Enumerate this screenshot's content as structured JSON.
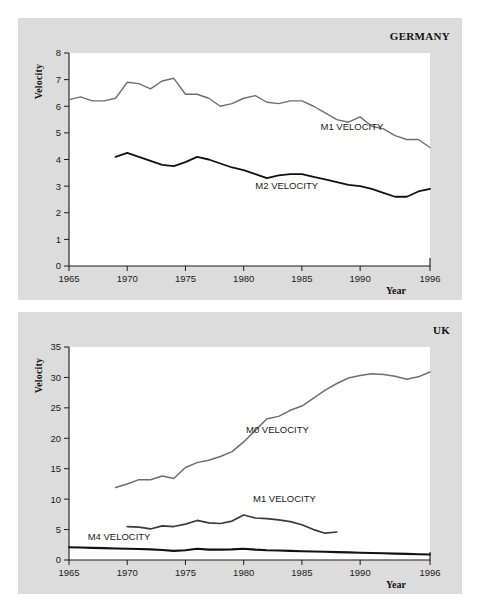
{
  "figure": {
    "background_color": "#ffffff",
    "panel_color": "#dcdcdc",
    "plot_color": "#ffffff"
  },
  "panels": [
    {
      "id": "germany",
      "title": "GERMANY",
      "ylabel": "Velocity",
      "xlabel": "Year"
    },
    {
      "id": "uk",
      "title": "UK",
      "ylabel": "Velocity",
      "xlabel": "Year"
    }
  ],
  "chart_data": [
    {
      "type": "line",
      "title": "GERMANY",
      "xlabel": "Year",
      "ylabel": "Velocity",
      "xlim": [
        1965,
        1996
      ],
      "ylim": [
        0,
        8
      ],
      "xticks": [
        1965,
        1970,
        1975,
        1980,
        1985,
        1990,
        1996
      ],
      "xtick_labels": [
        "1965",
        "1970",
        "1975",
        "1980",
        "1985",
        "1990",
        "1996"
      ],
      "yticks": [
        0,
        1,
        2,
        3,
        4,
        5,
        6,
        7,
        8
      ],
      "ytick_labels": [
        "0",
        "1",
        "2",
        "3",
        "4",
        "5",
        "6",
        "7",
        "8"
      ],
      "grid": false,
      "legend": "inline-annotations",
      "series": [
        {
          "name": "M1 VELOCITY",
          "color": "#6e6e6e",
          "width": 1.4,
          "label_x": 1986.6,
          "label_y": 5.12,
          "x": [
            1965,
            1966,
            1967,
            1968,
            1969,
            1970,
            1971,
            1972,
            1973,
            1974,
            1975,
            1976,
            1977,
            1978,
            1979,
            1980,
            1981,
            1982,
            1983,
            1984,
            1985,
            1986,
            1987,
            1988,
            1989,
            1990,
            1991,
            1992,
            1993,
            1994,
            1995,
            1996
          ],
          "y": [
            6.25,
            6.35,
            6.2,
            6.2,
            6.3,
            6.9,
            6.85,
            6.65,
            6.95,
            7.05,
            6.45,
            6.45,
            6.3,
            6.0,
            6.1,
            6.3,
            6.4,
            6.15,
            6.1,
            6.2,
            6.2,
            6.0,
            5.75,
            5.5,
            5.4,
            5.6,
            5.25,
            5.15,
            4.9,
            4.75,
            4.75,
            4.45
          ]
        },
        {
          "name": "M2 VELOCITY",
          "color": "#111111",
          "width": 1.8,
          "label_x": 1981.0,
          "label_y": 2.88,
          "x": [
            1969,
            1970,
            1971,
            1972,
            1973,
            1974,
            1975,
            1976,
            1977,
            1978,
            1979,
            1980,
            1981,
            1982,
            1983,
            1984,
            1985,
            1986,
            1987,
            1988,
            1989,
            1990,
            1991,
            1992,
            1993,
            1994,
            1995,
            1996
          ],
          "y": [
            4.1,
            4.25,
            4.1,
            3.95,
            3.8,
            3.75,
            3.9,
            4.1,
            4.0,
            3.85,
            3.7,
            3.6,
            3.45,
            3.3,
            3.4,
            3.45,
            3.45,
            3.35,
            3.25,
            3.15,
            3.05,
            3.0,
            2.9,
            2.75,
            2.6,
            2.6,
            2.8,
            2.9
          ]
        }
      ]
    },
    {
      "type": "line",
      "title": "UK",
      "xlabel": "Year",
      "ylabel": "Velocity",
      "xlim": [
        1965,
        1996
      ],
      "ylim": [
        0,
        35
      ],
      "xticks": [
        1965,
        1970,
        1975,
        1980,
        1985,
        1990,
        1996
      ],
      "xtick_labels": [
        "1965",
        "1970",
        "1975",
        "1980",
        "1985",
        "1990",
        "1996"
      ],
      "yticks": [
        0,
        5,
        10,
        15,
        20,
        25,
        30,
        35
      ],
      "ytick_labels": [
        "0",
        "5",
        "10",
        "15",
        "20",
        "25",
        "30",
        "35"
      ],
      "grid": false,
      "legend": "inline-annotations",
      "series": [
        {
          "name": "M0 VELOCITY",
          "color": "#6e6e6e",
          "width": 1.5,
          "label_x": 1980.2,
          "label_y": 20.8,
          "x": [
            1969,
            1970,
            1971,
            1972,
            1973,
            1974,
            1975,
            1976,
            1977,
            1978,
            1979,
            1980,
            1981,
            1982,
            1983,
            1984,
            1985,
            1986,
            1987,
            1988,
            1989,
            1990,
            1991,
            1992,
            1993,
            1994,
            1995,
            1996
          ],
          "y": [
            11.9,
            12.5,
            13.2,
            13.2,
            13.8,
            13.4,
            15.2,
            16.0,
            16.4,
            17.0,
            17.8,
            19.4,
            21.3,
            23.2,
            23.6,
            24.6,
            25.3,
            26.6,
            27.9,
            29.0,
            29.9,
            30.3,
            30.6,
            30.5,
            30.2,
            29.7,
            30.1,
            30.9
          ]
        },
        {
          "name": "M1 VELOCITY",
          "color": "#3a3a3a",
          "width": 1.7,
          "label_x": 1980.8,
          "label_y": 9.6,
          "x": [
            1970,
            1971,
            1972,
            1973,
            1974,
            1975,
            1976,
            1977,
            1978,
            1979,
            1980,
            1981,
            1982,
            1983,
            1984,
            1985,
            1986,
            1987,
            1988
          ],
          "y": [
            5.5,
            5.4,
            5.1,
            5.6,
            5.5,
            5.9,
            6.5,
            6.1,
            6.0,
            6.4,
            7.4,
            6.9,
            6.8,
            6.6,
            6.3,
            5.8,
            5.0,
            4.4,
            4.6
          ]
        },
        {
          "name": "M4 VELOCITY",
          "color": "#111111",
          "width": 2.1,
          "label_x": 1966.6,
          "label_y": 3.35,
          "x": [
            1965,
            1966,
            1967,
            1968,
            1969,
            1970,
            1971,
            1972,
            1973,
            1974,
            1975,
            1976,
            1977,
            1978,
            1979,
            1980,
            1981,
            1982,
            1983,
            1984,
            1985,
            1986,
            1987,
            1988,
            1989,
            1990,
            1991,
            1992,
            1993,
            1994,
            1995,
            1996
          ],
          "y": [
            2.1,
            2.05,
            2.0,
            1.95,
            1.9,
            1.85,
            1.8,
            1.75,
            1.65,
            1.5,
            1.6,
            1.85,
            1.7,
            1.7,
            1.75,
            1.85,
            1.7,
            1.6,
            1.55,
            1.5,
            1.45,
            1.4,
            1.35,
            1.3,
            1.25,
            1.2,
            1.15,
            1.1,
            1.05,
            1.0,
            0.95,
            0.9
          ]
        }
      ]
    }
  ]
}
